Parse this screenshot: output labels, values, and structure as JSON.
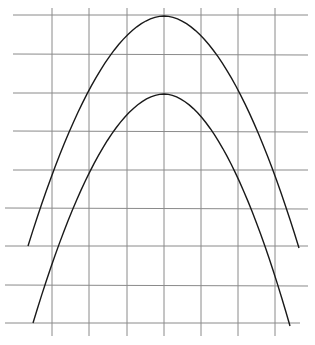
{
  "diagram": {
    "colors": {
      "background": "#ffffff",
      "grid": "#8a8a8a",
      "curve": "#1a1a1a"
    },
    "grid": {
      "horizontal_lines_y": [
        15,
        54,
        93,
        131,
        170,
        208,
        246,
        285,
        323
      ],
      "vertical_lines_x": [
        52,
        89,
        127,
        164,
        201,
        238,
        275
      ],
      "horizontal_x_range": [
        13,
        308
      ],
      "vertical_y_range": [
        8,
        336
      ]
    },
    "curves": [
      {
        "name": "outer-arch",
        "apex": [
          164,
          16
        ],
        "left_end": [
          28,
          246
        ],
        "right_end": [
          299,
          248
        ]
      },
      {
        "name": "inner-arch",
        "apex": [
          164,
          94
        ],
        "left_end": [
          33,
          323
        ],
        "right_end": [
          290,
          326
        ]
      }
    ]
  }
}
